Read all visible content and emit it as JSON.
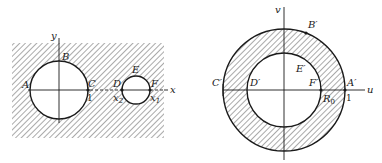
{
  "left_figure": {
    "description": "z-plane: hatched region outside two circles",
    "axis_y_label": "y",
    "axis_x_label": "x",
    "points": {
      "A": "A",
      "B": "B",
      "C": "C",
      "D": "D",
      "E": "E",
      "F": "F"
    },
    "tick_labels": {
      "one": "1",
      "x2": "x",
      "x2_sub": "2",
      "x1": "x",
      "x1_sub": "1"
    }
  },
  "right_figure": {
    "description": "w-plane: hatched annulus between circles of radius R0 and 1",
    "axis_v_label": "v",
    "axis_u_label": "u",
    "points": {
      "A": "A′",
      "B": "B′",
      "C": "C′",
      "D": "D′",
      "E": "E′",
      "F": "F′"
    },
    "tick_labels": {
      "one": "1",
      "r0": "R",
      "r0_sub": "0"
    }
  },
  "colors": {
    "ink": "#1a1a1a",
    "hatch": "#555555",
    "background": "#ffffff"
  }
}
